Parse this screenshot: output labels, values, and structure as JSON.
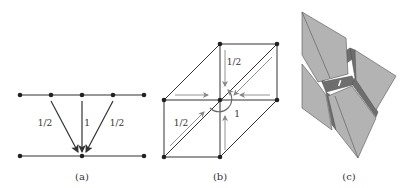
{
  "figure": {
    "panels": [
      {
        "id": "a",
        "caption": "(a)",
        "weights": {
          "left": "1/2",
          "center": "1",
          "right": "1/2"
        }
      },
      {
        "id": "b",
        "caption": "(b)",
        "weights": {
          "top": "1/2",
          "diagonal": "1/2",
          "rotation": "1"
        }
      },
      {
        "id": "c",
        "caption": "(c)"
      }
    ],
    "colors": {
      "line": "#333333",
      "arrow_light": "#8a8a8a",
      "face": "#b3b3b3",
      "face_dark": "#6e6e6e",
      "edge": "#555555"
    }
  }
}
